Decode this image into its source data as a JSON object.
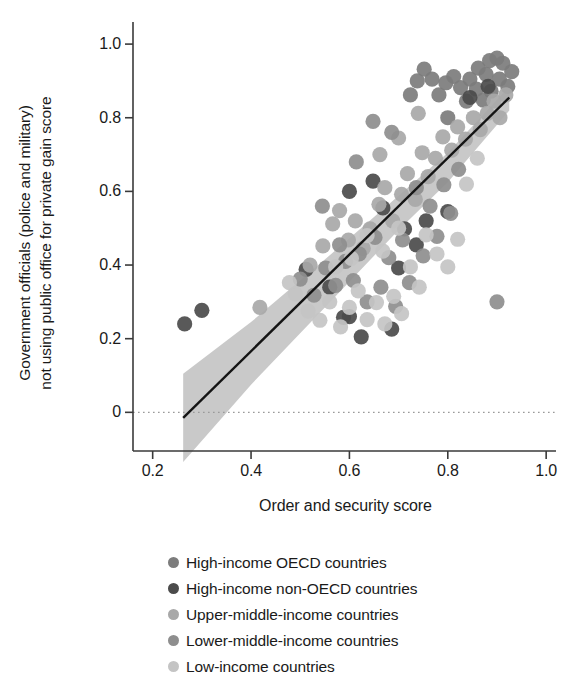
{
  "chart_data": {
    "type": "scatter",
    "title": "",
    "xlabel": "Order and security score",
    "ylabel": "Government officials (police and military)\nnot using public office for private gain score",
    "xlim": [
      0.16,
      1.02
    ],
    "ylim": [
      -0.105,
      1.06
    ],
    "xticks": [
      0.2,
      0.4,
      0.6,
      0.8,
      1.0
    ],
    "xtick_labels": [
      "0.2",
      "0.4",
      "0.6",
      "0.8",
      "1.0"
    ],
    "yticks": [
      0,
      0.2,
      0.4,
      0.6,
      0.8,
      1.0
    ],
    "ytick_labels": [
      "0",
      "0.2",
      "0.4",
      "0.6",
      "0.8",
      "1.0"
    ],
    "grid": false,
    "zero_line": {
      "y": 0,
      "style": "dotted",
      "color": "#9a9a9a"
    },
    "legend_position": "below-axes",
    "fit_line": {
      "color": "#141414",
      "x": [
        0.262,
        0.925
      ],
      "y": [
        -0.015,
        0.855
      ]
    },
    "confidence_band": {
      "color": "#bfbfbf",
      "x": [
        0.262,
        0.4,
        0.55,
        0.7,
        0.8,
        0.925
      ],
      "upper": [
        0.105,
        0.245,
        0.415,
        0.588,
        0.705,
        0.885
      ],
      "lower": [
        -0.135,
        0.075,
        0.285,
        0.495,
        0.625,
        0.82
      ]
    },
    "series": [
      {
        "name": "High-income OECD countries",
        "color": "#7c7c7c",
        "points": [
          [
            0.845,
            0.905
          ],
          [
            0.862,
            0.935
          ],
          [
            0.878,
            0.918
          ],
          [
            0.885,
            0.955
          ],
          [
            0.9,
            0.962
          ],
          [
            0.912,
            0.948
          ],
          [
            0.905,
            0.905
          ],
          [
            0.888,
            0.872
          ],
          [
            0.872,
            0.848
          ],
          [
            0.858,
            0.878
          ],
          [
            0.838,
            0.845
          ],
          [
            0.826,
            0.882
          ],
          [
            0.812,
            0.912
          ],
          [
            0.796,
            0.895
          ],
          [
            0.782,
            0.862
          ],
          [
            0.768,
            0.905
          ],
          [
            0.752,
            0.932
          ],
          [
            0.738,
            0.9
          ],
          [
            0.922,
            0.885
          ],
          [
            0.93,
            0.925
          ],
          [
            0.724,
            0.862
          ],
          [
            0.8,
            0.8
          ]
        ]
      },
      {
        "name": "High-income non-OECD countries",
        "color": "#4b4b4b",
        "points": [
          [
            0.265,
            0.24
          ],
          [
            0.3,
            0.277
          ],
          [
            0.56,
            0.34
          ],
          [
            0.588,
            0.258
          ],
          [
            0.6,
            0.6
          ],
          [
            0.648,
            0.628
          ],
          [
            0.668,
            0.555
          ],
          [
            0.7,
            0.392
          ],
          [
            0.712,
            0.498
          ],
          [
            0.756,
            0.52
          ],
          [
            0.8,
            0.545
          ],
          [
            0.845,
            0.855
          ],
          [
            0.882,
            0.885
          ],
          [
            0.512,
            0.388
          ],
          [
            0.624,
            0.205
          ],
          [
            0.686,
            0.226
          ],
          [
            0.736,
            0.455
          ],
          [
            0.6,
            0.26
          ]
        ]
      },
      {
        "name": "Upper-middle-income countries",
        "color": "#a8a8a8",
        "points": [
          [
            0.418,
            0.285
          ],
          [
            0.52,
            0.4
          ],
          [
            0.546,
            0.452
          ],
          [
            0.566,
            0.512
          ],
          [
            0.58,
            0.548
          ],
          [
            0.598,
            0.468
          ],
          [
            0.612,
            0.52
          ],
          [
            0.628,
            0.445
          ],
          [
            0.642,
            0.498
          ],
          [
            0.66,
            0.565
          ],
          [
            0.672,
            0.61
          ],
          [
            0.688,
            0.52
          ],
          [
            0.706,
            0.592
          ],
          [
            0.718,
            0.648
          ],
          [
            0.734,
            0.578
          ],
          [
            0.748,
            0.705
          ],
          [
            0.76,
            0.64
          ],
          [
            0.775,
            0.69
          ],
          [
            0.79,
            0.748
          ],
          [
            0.808,
            0.712
          ],
          [
            0.82,
            0.775
          ],
          [
            0.836,
            0.742
          ],
          [
            0.852,
            0.8
          ],
          [
            0.866,
            0.768
          ],
          [
            0.88,
            0.812
          ],
          [
            0.894,
            0.845
          ],
          [
            0.906,
            0.8
          ],
          [
            0.918,
            0.862
          ],
          [
            0.7,
            0.745
          ],
          [
            0.74,
            0.812
          ],
          [
            0.662,
            0.7
          ]
        ]
      },
      {
        "name": "Lower-middle-income countries",
        "color": "#8e8e8e",
        "points": [
          [
            0.5,
            0.362
          ],
          [
            0.528,
            0.318
          ],
          [
            0.552,
            0.392
          ],
          [
            0.572,
            0.345
          ],
          [
            0.592,
            0.41
          ],
          [
            0.608,
            0.358
          ],
          [
            0.62,
            0.43
          ],
          [
            0.636,
            0.3
          ],
          [
            0.652,
            0.475
          ],
          [
            0.664,
            0.34
          ],
          [
            0.68,
            0.42
          ],
          [
            0.694,
            0.288
          ],
          [
            0.708,
            0.468
          ],
          [
            0.722,
            0.352
          ],
          [
            0.736,
            0.61
          ],
          [
            0.75,
            0.425
          ],
          [
            0.764,
            0.56
          ],
          [
            0.778,
            0.478
          ],
          [
            0.792,
            0.618
          ],
          [
            0.806,
            0.54
          ],
          [
            0.822,
            0.66
          ],
          [
            0.9,
            0.3
          ],
          [
            0.614,
            0.68
          ],
          [
            0.648,
            0.79
          ],
          [
            0.686,
            0.76
          ],
          [
            0.58,
            0.455
          ],
          [
            0.545,
            0.56
          ]
        ]
      },
      {
        "name": "Low-income countries",
        "color": "#c4c4c4",
        "points": [
          [
            0.49,
            0.322
          ],
          [
            0.516,
            0.275
          ],
          [
            0.54,
            0.25
          ],
          [
            0.56,
            0.3
          ],
          [
            0.582,
            0.232
          ],
          [
            0.6,
            0.285
          ],
          [
            0.618,
            0.33
          ],
          [
            0.636,
            0.252
          ],
          [
            0.655,
            0.298
          ],
          [
            0.672,
            0.24
          ],
          [
            0.69,
            0.315
          ],
          [
            0.706,
            0.268
          ],
          [
            0.724,
            0.395
          ],
          [
            0.742,
            0.34
          ],
          [
            0.7,
            0.5
          ],
          [
            0.668,
            0.438
          ],
          [
            0.636,
            0.48
          ],
          [
            0.604,
            0.418
          ],
          [
            0.572,
            0.395
          ],
          [
            0.778,
            0.43
          ],
          [
            0.756,
            0.482
          ],
          [
            0.8,
            0.395
          ],
          [
            0.82,
            0.47
          ],
          [
            0.86,
            0.69
          ],
          [
            0.838,
            0.62
          ],
          [
            0.478,
            0.352
          ]
        ]
      }
    ]
  },
  "legend": {
    "items": [
      {
        "label": "High-income OECD countries",
        "color": "#7c7c7c"
      },
      {
        "label": "High-income non-OECD countries",
        "color": "#4b4b4b"
      },
      {
        "label": "Upper-middle-income countries",
        "color": "#a8a8a8"
      },
      {
        "label": "Lower-middle-income countries",
        "color": "#8e8e8e"
      },
      {
        "label": "Low-income countries",
        "color": "#c4c4c4"
      }
    ]
  },
  "axes": {
    "frame_color": "#3a3a3a"
  }
}
